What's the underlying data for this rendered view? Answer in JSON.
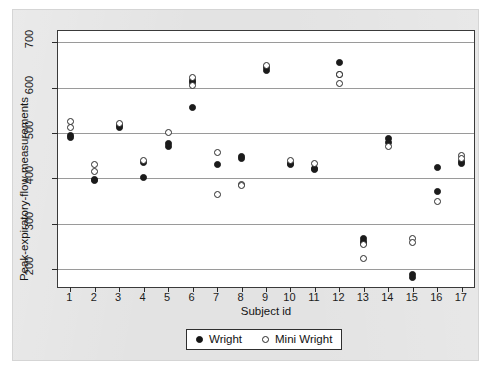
{
  "figure": {
    "background_color": "#e3e3e3",
    "plot_background_color": "#ffffff",
    "grid_color": "#9a9a9a"
  },
  "legend": {
    "position": "bottom-center-outside",
    "entries": [
      {
        "label": "Wright",
        "marker": "filled-circle",
        "color": "#151515"
      },
      {
        "label": "Mini Wright",
        "marker": "open-circle",
        "color": "#ffffff"
      }
    ]
  },
  "chart_data": {
    "type": "scatter",
    "title": "",
    "xlabel": "Subject id",
    "ylabel": "Peak-expiratory-flow measurements",
    "xlim": [
      0.5,
      17.5
    ],
    "ylim": [
      160,
      725
    ],
    "yticks": [
      200,
      300,
      400,
      500,
      600,
      700
    ],
    "xticks": [
      1,
      2,
      3,
      4,
      5,
      6,
      7,
      8,
      9,
      10,
      11,
      12,
      13,
      14,
      15,
      16,
      17
    ],
    "grid": "horizontal",
    "series": [
      {
        "name": "Wright",
        "marker": "filled-circle",
        "color": "#151515",
        "points": [
          {
            "x": 1,
            "y": 494
          },
          {
            "x": 1,
            "y": 490
          },
          {
            "x": 2,
            "y": 395
          },
          {
            "x": 2,
            "y": 397
          },
          {
            "x": 3,
            "y": 516
          },
          {
            "x": 3,
            "y": 512
          },
          {
            "x": 4,
            "y": 434
          },
          {
            "x": 4,
            "y": 401
          },
          {
            "x": 5,
            "y": 476
          },
          {
            "x": 5,
            "y": 470
          },
          {
            "x": 6,
            "y": 557
          },
          {
            "x": 6,
            "y": 611
          },
          {
            "x": 6,
            "y": 615
          },
          {
            "x": 7,
            "y": 430
          },
          {
            "x": 8,
            "y": 447
          },
          {
            "x": 8,
            "y": 443
          },
          {
            "x": 9,
            "y": 637
          },
          {
            "x": 9,
            "y": 644
          },
          {
            "x": 10,
            "y": 432
          },
          {
            "x": 10,
            "y": 430
          },
          {
            "x": 11,
            "y": 421
          },
          {
            "x": 11,
            "y": 419
          },
          {
            "x": 12,
            "y": 656
          },
          {
            "x": 12,
            "y": 630
          },
          {
            "x": 13,
            "y": 267
          },
          {
            "x": 13,
            "y": 260
          },
          {
            "x": 13,
            "y": 255
          },
          {
            "x": 14,
            "y": 487
          },
          {
            "x": 14,
            "y": 480
          },
          {
            "x": 15,
            "y": 187
          },
          {
            "x": 15,
            "y": 181
          },
          {
            "x": 16,
            "y": 423
          },
          {
            "x": 16,
            "y": 370
          },
          {
            "x": 17,
            "y": 437
          },
          {
            "x": 17,
            "y": 433
          }
        ]
      },
      {
        "name": "Mini Wright",
        "marker": "open-circle",
        "color": "#ffffff",
        "points": [
          {
            "x": 1,
            "y": 512
          },
          {
            "x": 1,
            "y": 525
          },
          {
            "x": 2,
            "y": 415
          },
          {
            "x": 2,
            "y": 430
          },
          {
            "x": 3,
            "y": 520
          },
          {
            "x": 4,
            "y": 440
          },
          {
            "x": 5,
            "y": 501
          },
          {
            "x": 6,
            "y": 622
          },
          {
            "x": 6,
            "y": 604
          },
          {
            "x": 7,
            "y": 456
          },
          {
            "x": 7,
            "y": 365
          },
          {
            "x": 8,
            "y": 387
          },
          {
            "x": 8,
            "y": 383
          },
          {
            "x": 9,
            "y": 648
          },
          {
            "x": 10,
            "y": 440
          },
          {
            "x": 11,
            "y": 432
          },
          {
            "x": 12,
            "y": 610
          },
          {
            "x": 12,
            "y": 628
          },
          {
            "x": 13,
            "y": 253
          },
          {
            "x": 13,
            "y": 224
          },
          {
            "x": 14,
            "y": 471
          },
          {
            "x": 15,
            "y": 267
          },
          {
            "x": 15,
            "y": 258
          },
          {
            "x": 16,
            "y": 348
          },
          {
            "x": 17,
            "y": 451
          },
          {
            "x": 17,
            "y": 444
          }
        ]
      }
    ]
  }
}
